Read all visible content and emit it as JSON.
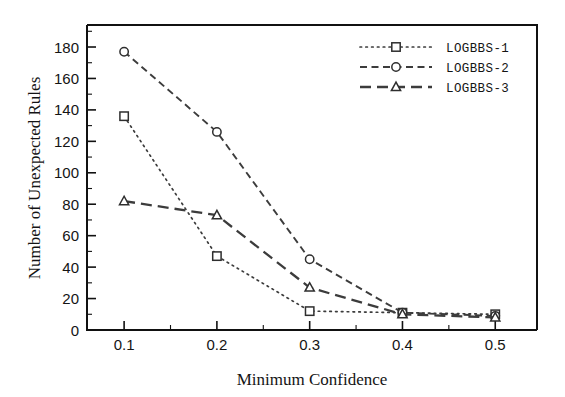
{
  "chart_data": {
    "type": "line",
    "title": "",
    "xlabel": "Minimum Confidence",
    "ylabel": "Number of Unexpected Rules",
    "x": [
      0.1,
      0.2,
      0.3,
      0.4,
      0.5
    ],
    "xtick_labels": [
      "0.1",
      "0.2",
      "0.3",
      "0.4",
      "0.5"
    ],
    "ytick_labels": [
      "0",
      "20",
      "40",
      "60",
      "80",
      "100",
      "120",
      "140",
      "160",
      "180"
    ],
    "ytick_values": [
      0,
      20,
      40,
      60,
      80,
      100,
      120,
      140,
      160,
      180
    ],
    "xlim": [
      0.06,
      0.545
    ],
    "ylim": [
      0,
      194
    ],
    "grid": false,
    "legend_position": "top-right",
    "series": [
      {
        "name": "LOGBBS-1",
        "values": [
          136,
          47,
          12,
          11,
          10
        ],
        "marker": "square",
        "linestyle": "dotted",
        "color": "#3c3c3c"
      },
      {
        "name": "LOGBBS-2",
        "values": [
          177,
          126,
          45,
          11,
          9
        ],
        "marker": "circle",
        "linestyle": "dashed",
        "color": "#3c3c3c"
      },
      {
        "name": "LOGBBS-3",
        "values": [
          82,
          73,
          27,
          10,
          8
        ],
        "marker": "triangle",
        "linestyle": "long-dashed",
        "color": "#3c3c3c"
      }
    ]
  },
  "legend": {
    "entries": [
      {
        "label": "LOGBBS-1"
      },
      {
        "label": "LOGBBS-2"
      },
      {
        "label": "LOGBBS-3"
      }
    ]
  }
}
